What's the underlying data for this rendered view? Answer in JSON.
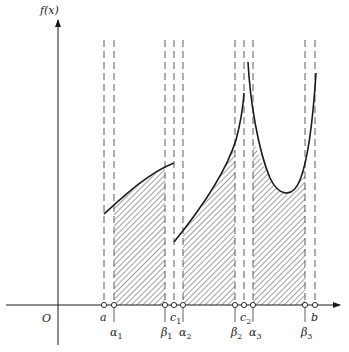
{
  "figure": {
    "y_axis_label": "f(x)",
    "origin_label": "O",
    "colors": {
      "ink": "#1a1a1a",
      "hatch": "#444444",
      "dash": "#333333",
      "background": "#ffffff"
    }
  },
  "axes": {
    "x_axis_y": 305,
    "x_axis_start": 6,
    "x_axis_end": 340,
    "y_axis_x": 58,
    "y_axis_top": 20,
    "y_axis_bottom": 345
  },
  "points": [
    {
      "id": "a",
      "base": "a",
      "sub": "",
      "x": 104,
      "label_row": 1
    },
    {
      "id": "alpha1",
      "base": "α",
      "sub": "1",
      "x": 114,
      "label_row": 2
    },
    {
      "id": "beta1",
      "base": "β",
      "sub": "1",
      "x": 165,
      "label_row": 2
    },
    {
      "id": "c1",
      "base": "c",
      "sub": "1",
      "x": 174,
      "label_row": 1
    },
    {
      "id": "alpha2",
      "base": "α",
      "sub": "2",
      "x": 183,
      "label_row": 2
    },
    {
      "id": "beta2",
      "base": "β",
      "sub": "2",
      "x": 235,
      "label_row": 2
    },
    {
      "id": "c2",
      "base": "c",
      "sub": "2",
      "x": 244,
      "label_row": 1
    },
    {
      "id": "alpha3",
      "base": "α",
      "sub": "3",
      "x": 253,
      "label_row": 2
    },
    {
      "id": "beta3",
      "base": "β",
      "sub": "3",
      "x": 305,
      "label_row": 2
    },
    {
      "id": "b",
      "base": "b",
      "sub": "",
      "x": 315,
      "label_row": 1
    }
  ],
  "dashed_lines": {
    "top_y": 40,
    "xs": [
      104,
      114,
      165,
      174,
      183,
      235,
      244,
      253,
      305,
      315
    ]
  },
  "curve_segments": [
    {
      "name": "segment-1",
      "description": "concave increasing on [a, c1)",
      "path": "M104,214 C125,195 150,172 174,163"
    },
    {
      "name": "segment-2",
      "description": "convex increasing on (c1, c2) with singular peak",
      "path": "M174,242 C200,210 225,175 236,140 C240,125 243,108 244,93"
    },
    {
      "name": "segment-3",
      "description": "U-shape on (c2, b]",
      "path": "M248,62 C250,100 258,150 270,178 C278,195 292,200 300,180 C308,160 313,120 316,73"
    }
  ],
  "shaded_regions": [
    {
      "name": "region-1",
      "from": "alpha1",
      "to": "beta1",
      "path": "M114,305 L114,206 C128,193 148,177 165,168 L165,305 Z"
    },
    {
      "name": "region-2",
      "from": "alpha2",
      "to": "beta2",
      "path": "M183,305 L183,231 C200,211 220,185 235,143 L235,305 Z"
    },
    {
      "name": "region-3",
      "from": "alpha3",
      "to": "beta3",
      "path": "M253,305 L253,140 C259,155 264,168 270,178 C278,195 292,200 300,180 C302,175 304,168 305,163 L305,305 Z"
    }
  ]
}
